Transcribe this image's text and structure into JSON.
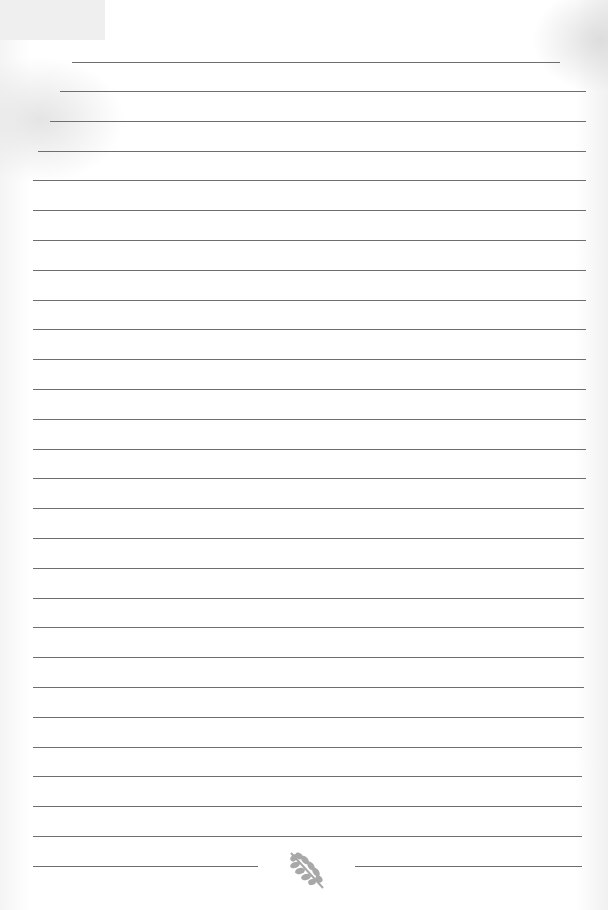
{
  "page": {
    "type": "lined-notebook-paper",
    "background_color": "#ffffff",
    "line_color": "#6e6e6e",
    "ornament_color": "#a8a8a8"
  },
  "rules": [
    {
      "y": 62,
      "x1": 72,
      "x2": 560
    },
    {
      "y": 91,
      "x1": 60,
      "x2": 586
    },
    {
      "y": 121,
      "x1": 50,
      "x2": 586
    },
    {
      "y": 151,
      "x1": 38,
      "x2": 586
    },
    {
      "y": 180,
      "x1": 33,
      "x2": 586
    },
    {
      "y": 210,
      "x1": 33,
      "x2": 586
    },
    {
      "y": 240,
      "x1": 33,
      "x2": 586
    },
    {
      "y": 270,
      "x1": 33,
      "x2": 586
    },
    {
      "y": 300,
      "x1": 33,
      "x2": 586
    },
    {
      "y": 329,
      "x1": 33,
      "x2": 586
    },
    {
      "y": 359,
      "x1": 33,
      "x2": 586
    },
    {
      "y": 389,
      "x1": 33,
      "x2": 586
    },
    {
      "y": 419,
      "x1": 33,
      "x2": 586
    },
    {
      "y": 449,
      "x1": 33,
      "x2": 586
    },
    {
      "y": 478,
      "x1": 33,
      "x2": 586
    },
    {
      "y": 508,
      "x1": 33,
      "x2": 584
    },
    {
      "y": 538,
      "x1": 33,
      "x2": 584
    },
    {
      "y": 568,
      "x1": 33,
      "x2": 584
    },
    {
      "y": 598,
      "x1": 33,
      "x2": 584
    },
    {
      "y": 627,
      "x1": 33,
      "x2": 584
    },
    {
      "y": 657,
      "x1": 33,
      "x2": 584
    },
    {
      "y": 687,
      "x1": 33,
      "x2": 584
    },
    {
      "y": 717,
      "x1": 33,
      "x2": 584
    },
    {
      "y": 747,
      "x1": 33,
      "x2": 582
    },
    {
      "y": 776,
      "x1": 33,
      "x2": 582
    },
    {
      "y": 806,
      "x1": 33,
      "x2": 582
    },
    {
      "y": 836,
      "x1": 33,
      "x2": 582
    }
  ],
  "footer": {
    "left_rule": {
      "y": 866,
      "x1": 33,
      "x2": 258
    },
    "right_rule": {
      "y": 866,
      "x1": 355,
      "x2": 582
    },
    "ornament_icon": "leaf-icon"
  }
}
